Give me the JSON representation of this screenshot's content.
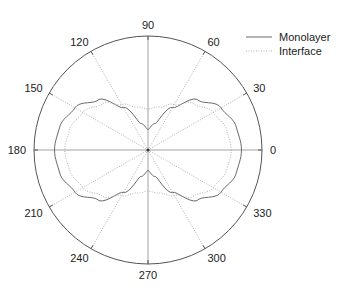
{
  "chart_data": {
    "type": "polar-line",
    "title": "",
    "angular_ticks": [
      0,
      30,
      60,
      90,
      120,
      150,
      180,
      210,
      240,
      270,
      300,
      330
    ],
    "angular_tick_labels": [
      "0",
      "30",
      "60",
      "90",
      "120",
      "150",
      "180",
      "210",
      "240",
      "270",
      "300",
      "330"
    ],
    "radial_range": [
      0,
      1
    ],
    "grid": true,
    "legend_position": "top-right",
    "colors": {
      "monolayer": "#6a6a6a",
      "interface": "#b0b0b0",
      "axis": "#555555",
      "grid": "#9a9a9a"
    },
    "series": [
      {
        "name": "Monolayer",
        "style": "solid",
        "theta_deg": [
          0,
          15,
          30,
          45,
          60,
          75,
          90
        ],
        "r": [
          0.82,
          0.8,
          0.74,
          0.62,
          0.43,
          0.24,
          0.18
        ],
        "symmetry": "mirror about 0-180 and 90-270 axes"
      },
      {
        "name": "Interface",
        "style": "dotted",
        "theta_deg": [
          0,
          15,
          30,
          45,
          60,
          75,
          90
        ],
        "r": [
          0.73,
          0.71,
          0.66,
          0.57,
          0.46,
          0.39,
          0.36
        ],
        "symmetry": "mirror about 0-180 and 90-270 axes"
      }
    ]
  },
  "legend": {
    "items": [
      {
        "label": "Monolayer",
        "style": "solid"
      },
      {
        "label": "Interface",
        "style": "dotted"
      }
    ]
  }
}
